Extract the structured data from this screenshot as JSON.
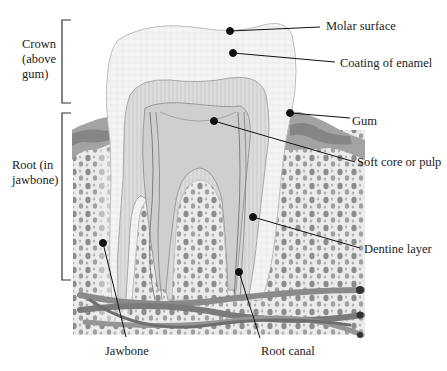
{
  "diagram": {
    "brackets": [
      {
        "id": "crown",
        "label": "Crown (above gum)",
        "lines": [
          "Crown",
          "(above",
          "gum)"
        ]
      },
      {
        "id": "root",
        "label": "Root (in jawbone)",
        "lines": [
          "Root (in",
          "jawbone)"
        ]
      }
    ],
    "callouts": [
      {
        "id": "molar-surface",
        "label": "Molar surface"
      },
      {
        "id": "coating-of-enamel",
        "label": "Coating of enamel"
      },
      {
        "id": "gum",
        "label": "Gum"
      },
      {
        "id": "soft-core-or-pulp",
        "label": "Soft core or pulp"
      },
      {
        "id": "dentine-layer",
        "label": "Dentine layer"
      },
      {
        "id": "jawbone",
        "label": "Jawbone"
      },
      {
        "id": "root-canal",
        "label": "Root canal"
      }
    ],
    "colors": {
      "leader": "#111111",
      "gum": "#9a9a9a",
      "gum_dark": "#7d7d7d",
      "enamel": "#f2f2f2",
      "dentine": "#d9d9d9",
      "pulp": "#c8c8c8",
      "bone": "#e6e6e6",
      "bone_holes": "#8a8a8a",
      "vessels": "#7a7a7a"
    }
  }
}
